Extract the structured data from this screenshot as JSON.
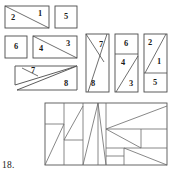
{
  "figure": {
    "caption_number": "18.",
    "stroke_color": "#4a4a4a",
    "fill_color": "#ffffff",
    "label_color": "#1a1a1a",
    "groups": [
      {
        "name": "top-row",
        "shapes": [
          {
            "name": "rect-diagonal-2-1",
            "labels": [
              "2",
              "1"
            ]
          },
          {
            "name": "square-5",
            "labels": [
              "5"
            ]
          }
        ]
      },
      {
        "name": "second-row",
        "shapes": [
          {
            "name": "square-6",
            "labels": [
              "6"
            ]
          },
          {
            "name": "rect-diagonal-4-3",
            "labels": [
              "4",
              "3"
            ]
          }
        ]
      },
      {
        "name": "third-row",
        "shapes": [
          {
            "name": "twin-triangles-7-8",
            "labels": [
              "7",
              "8"
            ]
          }
        ]
      },
      {
        "name": "tall-column-group",
        "shapes": [
          {
            "name": "tall-rect-7-8",
            "labels": [
              "7",
              "8"
            ]
          },
          {
            "name": "tall-rect-6-4-3",
            "labels": [
              "6",
              "4",
              "3"
            ]
          },
          {
            "name": "tall-rect-2-1-5",
            "labels": [
              "2",
              "1",
              "5"
            ]
          }
        ]
      },
      {
        "name": "assembled-rectangle",
        "shapes": [
          {
            "name": "assembled-dissection",
            "labels": []
          }
        ]
      }
    ],
    "labels": {
      "l1": "2",
      "l2": "1",
      "l3": "5",
      "l4": "6",
      "l5": "4",
      "l6": "3",
      "l7": "7",
      "l8": "8",
      "l9": "7",
      "l10": "8",
      "l11": "6",
      "l12": "4",
      "l13": "3",
      "l14": "2",
      "l15": "1",
      "l16": "5"
    }
  }
}
